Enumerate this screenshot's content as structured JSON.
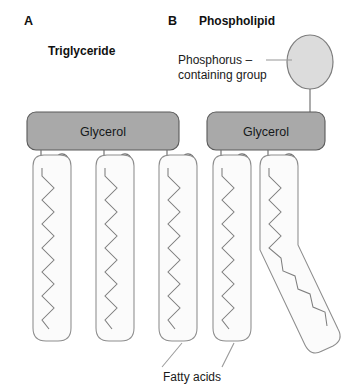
{
  "figure": {
    "background_color": "#ffffff",
    "panels": [
      {
        "letter": "A",
        "title": "Triglyceride",
        "glycerol_label": "Glycerol",
        "chain_count": 3,
        "ester_atom": "O"
      },
      {
        "letter": "B",
        "title": "Phospholipid",
        "glycerol_label": "Glycerol",
        "chain_count": 2,
        "ester_atom": "O",
        "head_label_line1": "Phosphorus –",
        "head_label_line2": "containing group"
      }
    ],
    "shared_label": "Fatty acids",
    "colors": {
      "glycerol_fill": "#a9a9a9",
      "glycerol_stroke": "#5a5a5a",
      "head_fill": "#dcdcdc",
      "head_stroke": "#7d7d7d",
      "chain_fill": "#fbfbfb",
      "chain_stroke": "#8d8d8d",
      "text": "#1a1a1a",
      "leader": "#9a9a9a"
    }
  }
}
